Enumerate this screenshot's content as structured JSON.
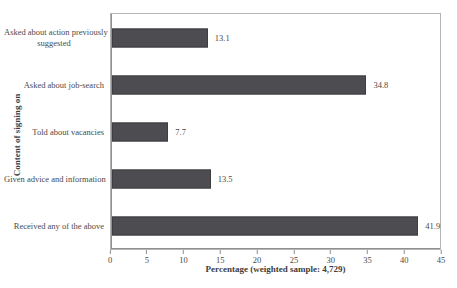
{
  "chart_data": {
    "type": "bar",
    "orientation": "horizontal",
    "title": "",
    "categories": [
      "Asked about action previously suggested",
      "Asked about job-search",
      "Told about vacancies",
      "Given advice and information",
      "Received any of the above"
    ],
    "category_lines": [
      [
        "Asked about action previously",
        "suggested"
      ],
      [
        "Asked about job-search"
      ],
      [
        "Told about vacancies"
      ],
      [
        "Given advice and information"
      ],
      [
        "Received any of the above"
      ]
    ],
    "values": [
      13.1,
      34.8,
      7.7,
      13.5,
      41.9
    ],
    "value_labels": [
      "13.1",
      "34.8",
      "7.7",
      "13.5",
      "41.9"
    ],
    "xlabel": "Percentage (weighted sample: 4,729)",
    "ylabel": "Content of signing on",
    "xlim": [
      0,
      45
    ],
    "xticks": [
      "0",
      "5",
      "10",
      "15",
      "20",
      "25",
      "30",
      "35",
      "40",
      "45"
    ],
    "grid": false,
    "legend": "none",
    "colors": {
      "bar": "#4c4c51",
      "bar_border": "#3e3e42",
      "axis": "#8f8f8f",
      "plot_border": "#b5b5b5",
      "text": "#4a4a4a",
      "title_text": "#3d3d3d",
      "background": "#ffffff"
    }
  }
}
